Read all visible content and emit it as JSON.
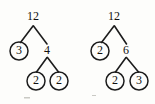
{
  "figure": {
    "background_color": "#fdfdfb",
    "ink_color": "#1c1c1c",
    "trees": [
      {
        "name": "left-factor-tree",
        "root": {
          "label": "12",
          "circled": false,
          "x": 33,
          "y": 17
        },
        "nodes": [
          {
            "id": "left-root",
            "label": "12",
            "circled": false,
            "x": 33,
            "y": 17
          },
          {
            "id": "left-leaf-3",
            "label": "3",
            "circled": true,
            "x": 19,
            "y": 51
          },
          {
            "id": "left-mid-4",
            "label": "4",
            "circled": false,
            "x": 47,
            "y": 51
          },
          {
            "id": "left-leaf-2a",
            "label": "2",
            "circled": true,
            "x": 36,
            "y": 81
          },
          {
            "id": "left-leaf-2b",
            "label": "2",
            "circled": true,
            "x": 59,
            "y": 81
          }
        ],
        "edges": [
          {
            "from": "left-root",
            "to": "left-leaf-3"
          },
          {
            "from": "left-root",
            "to": "left-mid-4"
          },
          {
            "from": "left-mid-4",
            "to": "left-leaf-2a"
          },
          {
            "from": "left-mid-4",
            "to": "left-leaf-2b"
          }
        ],
        "factorization": "12 = 3 x 2 x 2"
      },
      {
        "name": "right-factor-tree",
        "root": {
          "label": "12",
          "circled": false,
          "x": 114,
          "y": 17
        },
        "nodes": [
          {
            "id": "right-root",
            "label": "12",
            "circled": false,
            "x": 114,
            "y": 17
          },
          {
            "id": "right-leaf-2",
            "label": "2",
            "circled": true,
            "x": 100,
            "y": 51
          },
          {
            "id": "right-mid-6",
            "label": "6",
            "circled": false,
            "x": 126,
            "y": 51
          },
          {
            "id": "right-leaf-2b",
            "label": "2",
            "circled": true,
            "x": 115,
            "y": 81
          },
          {
            "id": "right-leaf-3",
            "label": "3",
            "circled": true,
            "x": 139,
            "y": 81
          }
        ],
        "edges": [
          {
            "from": "right-root",
            "to": "right-leaf-2"
          },
          {
            "from": "right-root",
            "to": "right-mid-6"
          },
          {
            "from": "right-mid-6",
            "to": "right-leaf-2b"
          },
          {
            "from": "right-mid-6",
            "to": "right-leaf-3"
          }
        ],
        "factorization": "12 = 2 x 2 x 3"
      }
    ]
  },
  "labels": {
    "left_root": "12",
    "left_child_a": "3",
    "left_child_b": "4",
    "left_grandchild_a": "2",
    "left_grandchild_b": "2",
    "right_root": "12",
    "right_child_a": "2",
    "right_child_b": "6",
    "right_grandchild_a": "2",
    "right_grandchild_b": "3"
  }
}
